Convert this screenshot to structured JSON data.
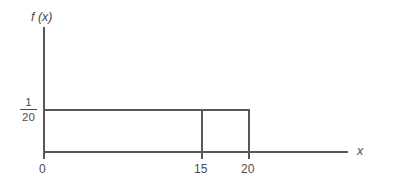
{
  "figure": {
    "title": "",
    "background_color": "#ffffff",
    "line_color": "#58585a",
    "text_color": "#4c4c4e"
  },
  "axes": {
    "y_label": "f (x)",
    "x_label": "x",
    "origin_label": "0"
  },
  "y_tick": {
    "numerator": "1",
    "denominator": "20"
  },
  "x_ticks": [
    {
      "label": "15"
    },
    {
      "label": "20"
    }
  ],
  "chart_data": {
    "type": "area",
    "title": "",
    "xlabel": "x",
    "ylabel": "f (x)",
    "distribution": "uniform",
    "x": [
      0,
      15,
      20
    ],
    "values": [
      0.05,
      0.05,
      0.05
    ],
    "density_label": "1/20",
    "density_value": 0.05,
    "support": [
      0,
      20
    ],
    "marked_x": 15,
    "xlim": [
      0,
      23
    ],
    "ylim": [
      0,
      0.0875
    ],
    "xticks": [
      0,
      15,
      20
    ],
    "xticklabels": [
      "0",
      "15",
      "20"
    ],
    "yticks": [
      0.05
    ],
    "yticklabels": [
      "1/20"
    ],
    "grid": false,
    "legend": "none",
    "annotations": []
  }
}
